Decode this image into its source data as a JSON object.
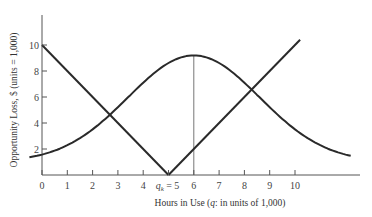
{
  "chart_data": {
    "type": "line",
    "title": "",
    "xlabel": "Hours in Use (q: in units of 1,000)",
    "ylabel": "Opportunity Loss, $ (units = 1,000)",
    "x_ticks": [
      0,
      1,
      2,
      3,
      4,
      5,
      6,
      7,
      8,
      9,
      10
    ],
    "x_tick_labels": [
      "0",
      "1",
      "2",
      "3",
      "4",
      "q_k = 5",
      "6",
      "7",
      "8",
      "9",
      "10"
    ],
    "y_ticks": [
      2,
      4,
      6,
      8,
      10
    ],
    "y_tick_labels": [
      "2",
      "4",
      "6",
      "8",
      "10"
    ],
    "xlim": [
      0,
      12.5
    ],
    "ylim": [
      0,
      12
    ],
    "grid": false,
    "legend": "none",
    "series": [
      {
        "name": "Opportunity loss (left linear)",
        "x": [
          0,
          5
        ],
        "y": [
          10,
          0
        ]
      },
      {
        "name": "Opportunity loss (right linear)",
        "x": [
          5,
          10.2
        ],
        "y": [
          0,
          10.4
        ]
      },
      {
        "name": "Probability-shaped curve",
        "x": [
          -0.5,
          0,
          1,
          2,
          2.7,
          3,
          4,
          5,
          6,
          7,
          8,
          8.3,
          9,
          10,
          11,
          12.2
        ],
        "y": [
          1.35,
          1.55,
          2.1,
          3.5,
          4.6,
          5.0,
          6.9,
          8.6,
          9.2,
          8.6,
          6.9,
          6.5,
          5.0,
          3.5,
          2.1,
          1.3
        ]
      }
    ],
    "annotations": [
      {
        "type": "vertical_line",
        "x": 6,
        "y_from": 0,
        "y_to": 9.2,
        "label": ""
      },
      {
        "type": "tick_label",
        "text": "q_k = 5",
        "x": 5
      }
    ]
  },
  "labels": {
    "xlabel_main": "Hours in Use (",
    "xlabel_q": "q",
    "xlabel_rest": ": in units of 1,000)",
    "ylabel": "Opportunity Loss, $ (units = 1,000)",
    "qk_q": "q",
    "qk_sub": "k",
    "qk_rest": " = 5"
  }
}
